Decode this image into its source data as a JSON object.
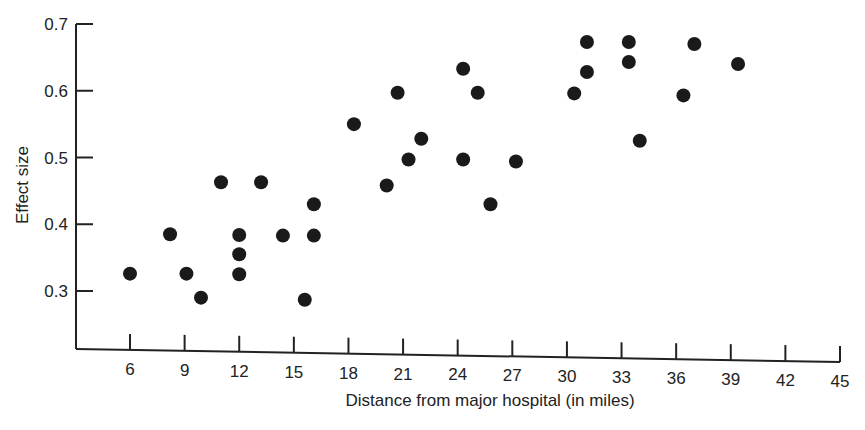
{
  "chart_data": {
    "type": "scatter",
    "title": "",
    "xlabel": "Distance from major hospital (in miles)",
    "ylabel": "Effect size",
    "xlim": [
      3,
      45
    ],
    "ylim": [
      0.22,
      0.7
    ],
    "xticks": [
      6,
      9,
      12,
      15,
      18,
      21,
      24,
      27,
      30,
      33,
      36,
      39,
      42,
      45
    ],
    "yticks": [
      0.3,
      0.4,
      0.5,
      0.6,
      0.7
    ],
    "grid": false,
    "legend": null,
    "marker_color": "#1a1a1a",
    "series": [
      {
        "name": "data",
        "points": [
          {
            "x": 6.0,
            "y": 0.326
          },
          {
            "x": 8.2,
            "y": 0.385
          },
          {
            "x": 9.1,
            "y": 0.326
          },
          {
            "x": 9.9,
            "y": 0.29
          },
          {
            "x": 11.0,
            "y": 0.463
          },
          {
            "x": 12.0,
            "y": 0.384
          },
          {
            "x": 12.0,
            "y": 0.355
          },
          {
            "x": 12.0,
            "y": 0.325
          },
          {
            "x": 13.2,
            "y": 0.463
          },
          {
            "x": 14.4,
            "y": 0.383
          },
          {
            "x": 15.6,
            "y": 0.287
          },
          {
            "x": 16.1,
            "y": 0.43
          },
          {
            "x": 16.1,
            "y": 0.383
          },
          {
            "x": 18.3,
            "y": 0.55
          },
          {
            "x": 20.1,
            "y": 0.458
          },
          {
            "x": 20.7,
            "y": 0.597
          },
          {
            "x": 21.3,
            "y": 0.497
          },
          {
            "x": 22.0,
            "y": 0.528
          },
          {
            "x": 24.3,
            "y": 0.633
          },
          {
            "x": 24.3,
            "y": 0.497
          },
          {
            "x": 25.1,
            "y": 0.597
          },
          {
            "x": 25.8,
            "y": 0.43
          },
          {
            "x": 27.2,
            "y": 0.494
          },
          {
            "x": 30.4,
            "y": 0.596
          },
          {
            "x": 31.1,
            "y": 0.673
          },
          {
            "x": 31.1,
            "y": 0.628
          },
          {
            "x": 33.4,
            "y": 0.673
          },
          {
            "x": 33.4,
            "y": 0.643
          },
          {
            "x": 34.0,
            "y": 0.525
          },
          {
            "x": 36.4,
            "y": 0.593
          },
          {
            "x": 37.0,
            "y": 0.67
          },
          {
            "x": 39.4,
            "y": 0.64
          }
        ]
      }
    ]
  }
}
